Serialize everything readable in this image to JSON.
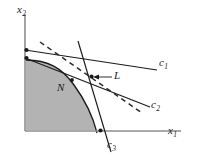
{
  "figure": {
    "background_color": "#ffffff",
    "stroke_color": "#1a1a1a",
    "axis_color": "#808080",
    "region_fill": "#b3b3b3",
    "axes": {
      "x_axis_label": "x",
      "x_axis_sub": "1",
      "y_axis_label": "x",
      "y_axis_sub": "2",
      "origin": {
        "x": 25,
        "y": 131
      }
    },
    "region": {
      "name": "N",
      "label": "N",
      "fill": "#b3b3b3",
      "description": "shaded convex feasible set bounded by curved frontier"
    },
    "point": {
      "name": "L",
      "label": "L",
      "description": "point of tangency / intersection of supporting lines",
      "x": 92,
      "y": 77
    },
    "lines": [
      {
        "id": "c1",
        "label": "c",
        "sub": "1",
        "style": "solid",
        "description": "shallow supporting line through L sloping down to the right"
      },
      {
        "id": "c2",
        "label": "c",
        "sub": "2",
        "style": "solid",
        "description": "steeper supporting line through L sloping down to the right"
      },
      {
        "id": "c3",
        "label": "c",
        "sub": "3",
        "style": "solid",
        "description": "near-vertical line through L descending to the x1 axis"
      },
      {
        "id": "dashed",
        "label": "",
        "sub": "",
        "style": "dashed",
        "description": "dashed supporting line through L with intermediate slope"
      }
    ],
    "markers": [
      {
        "name": "axis-intercept-upper",
        "x": 26,
        "y": 50
      },
      {
        "name": "axis-intercept-lower",
        "x": 26,
        "y": 58
      },
      {
        "name": "region-interior-dot",
        "x": 72,
        "y": 80
      },
      {
        "name": "x-axis-intercept",
        "x": 101,
        "y": 131
      },
      {
        "name": "tangency-point",
        "x": 92,
        "y": 77
      }
    ]
  }
}
